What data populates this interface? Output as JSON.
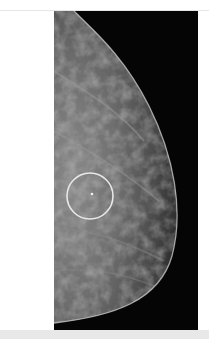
{
  "image": {
    "subject": "mammogram breast tissue image",
    "annotation": {
      "shape": "circle",
      "color": "#e8e8e8",
      "center": [
        90,
        196
      ],
      "radius": 23,
      "label": "highlighted region of interest"
    },
    "colors": {
      "background": "#050505",
      "tissue": "#6a6a6a",
      "skin_line": "#cfcfcf",
      "page": "#ffffff",
      "strip": "#e8e8e8"
    }
  },
  "caption": ""
}
